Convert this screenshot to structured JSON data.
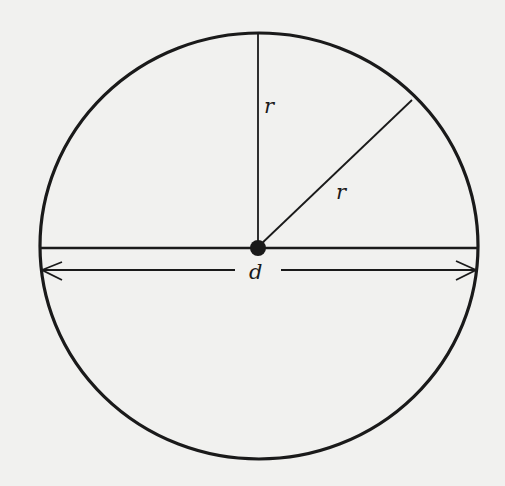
{
  "diagram": {
    "type": "circle-geometry",
    "background": "#f1f1ef",
    "stroke_color": "#1a1a1a",
    "circle": {
      "cx": 259,
      "cy": 246,
      "rx": 219,
      "ry": 213
    },
    "center_point": {
      "x": 259,
      "y": 246
    },
    "labels": {
      "vertical_radius": "r",
      "diagonal_radius": "r",
      "diameter": "d"
    },
    "elements": [
      {
        "name": "circle",
        "description": "circle outline"
      },
      {
        "name": "vertical-radius",
        "label": "r",
        "from": [
          259,
          246
        ],
        "to": [
          259,
          33
        ]
      },
      {
        "name": "diagonal-radius",
        "label": "r",
        "from": [
          259,
          246
        ],
        "to": [
          412,
          100
        ]
      },
      {
        "name": "diameter-line",
        "from": [
          41,
          246
        ],
        "to": [
          478,
          246
        ]
      },
      {
        "name": "diameter-dimension-arrow",
        "label": "d",
        "from": [
          41,
          270
        ],
        "to": [
          477,
          270
        ]
      },
      {
        "name": "center-point",
        "description": "filled dot at center"
      }
    ]
  }
}
